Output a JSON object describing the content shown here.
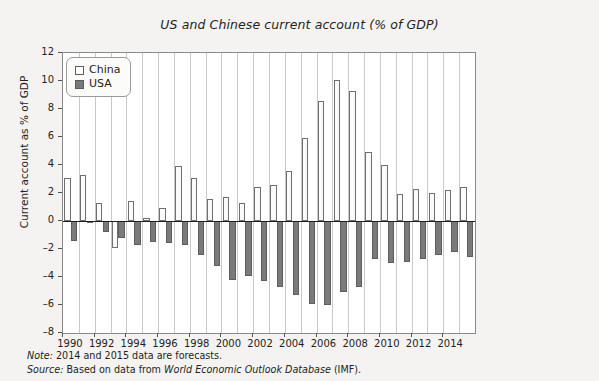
{
  "chart_data": {
    "type": "bar",
    "title": "US and Chinese current account (% of GDP)",
    "xlabel": "",
    "ylabel": "Current account as % of GDP",
    "ylim": [
      -8,
      12
    ],
    "ytick_values": [
      12,
      10,
      8,
      6,
      4,
      2,
      0,
      -2,
      -4,
      -6,
      -8
    ],
    "ytick_labels": [
      "12",
      "10",
      "8",
      "6",
      "4",
      "2",
      "0",
      "–2",
      "–4",
      "–6",
      "–8"
    ],
    "grid": "vertical",
    "legend_position": "top-left",
    "categories": [
      "1990",
      "1991",
      "1992",
      "1993",
      "1994",
      "1995",
      "1996",
      "1997",
      "1998",
      "1999",
      "2000",
      "2001",
      "2002",
      "2003",
      "2004",
      "2005",
      "2006",
      "2007",
      "2008",
      "2009",
      "2010",
      "2011",
      "2012",
      "2013",
      "2014",
      "2015"
    ],
    "xtick_labels": [
      "1990",
      "1992",
      "1994",
      "1996",
      "1998",
      "2000",
      "2002",
      "2004",
      "2006",
      "2008",
      "2010",
      "2012",
      "2014"
    ],
    "series": [
      {
        "name": "China",
        "color": "#ffffff",
        "values": [
          3.1,
          3.3,
          1.3,
          -1.9,
          1.4,
          0.2,
          0.9,
          3.9,
          3.1,
          1.6,
          1.7,
          1.3,
          2.4,
          2.6,
          3.6,
          5.9,
          8.6,
          10.1,
          9.3,
          4.9,
          4.0,
          1.9,
          2.3,
          2.0,
          2.2,
          2.4
        ]
      },
      {
        "name": "USA",
        "color": "#7a7a7a",
        "values": [
          -1.4,
          -0.1,
          -0.8,
          -1.2,
          -1.7,
          -1.5,
          -1.6,
          -1.7,
          -2.4,
          -3.2,
          -4.2,
          -3.9,
          -4.3,
          -4.7,
          -5.3,
          -5.9,
          -6.0,
          -5.1,
          -4.7,
          -2.7,
          -3.0,
          -2.9,
          -2.7,
          -2.4,
          -2.2,
          -2.6
        ]
      }
    ]
  },
  "legend": {
    "items": [
      {
        "label": "China",
        "swatch": "china"
      },
      {
        "label": "USA",
        "swatch": "usa"
      }
    ]
  },
  "footnotes": {
    "note_label": "Note:",
    "note_text": "2014 and 2015 data are forecasts.",
    "source_label": "Source:",
    "source_pre": "Based on data from",
    "source_italic": "World Economic Outlook Database",
    "source_post": "(IMF)."
  }
}
